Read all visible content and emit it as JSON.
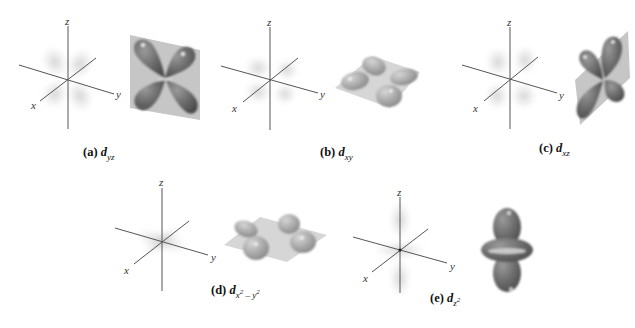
{
  "figure": {
    "panels": [
      {
        "id": "a",
        "letter": "(a)",
        "orbital": "d",
        "subscript": "yz",
        "sub_parts": [
          {
            "t": "yz"
          }
        ],
        "axes_labels": {
          "x": "x",
          "y": "y",
          "z": "z"
        },
        "description": "Four lobes lying in the yz plane, between the y and z axes"
      },
      {
        "id": "b",
        "letter": "(b)",
        "orbital": "d",
        "subscript": "xy",
        "sub_parts": [
          {
            "t": "xy"
          }
        ],
        "axes_labels": {
          "x": "x",
          "y": "y",
          "z": "z"
        },
        "description": "Four lobes lying in the xy plane, between the x and y axes"
      },
      {
        "id": "c",
        "letter": "(c)",
        "orbital": "d",
        "subscript": "xz",
        "sub_parts": [
          {
            "t": "xz"
          }
        ],
        "axes_labels": {
          "x": "x",
          "y": "y",
          "z": "z"
        },
        "description": "Four lobes lying in the xz plane, between the x and z axes"
      },
      {
        "id": "d",
        "letter": "(d)",
        "orbital": "d",
        "subscript": "x² − y²",
        "sub_parts": [
          {
            "t": "x",
            "sup": "2"
          },
          {
            "t": " – y",
            "sup": "2"
          }
        ],
        "axes_labels": {
          "x": "x",
          "y": "y",
          "z": "z"
        },
        "description": "Four lobes lying in the xy plane, along the x and y axes"
      },
      {
        "id": "e",
        "letter": "(e)",
        "orbital": "d",
        "subscript": "z²",
        "sub_parts": [
          {
            "t": "z",
            "sup": "2"
          }
        ],
        "axes_labels": {
          "x": "x",
          "y": "y",
          "z": "z"
        },
        "description": "Two lobes along the z axis with a torus (donut) in the xy plane"
      }
    ],
    "colors": {
      "lobe": "#6f6f6f",
      "lobe_light": "#a9a9a9",
      "plane": "#c4c4c4",
      "axis": "#555555",
      "cloud": "#d3d3d3",
      "background": "#ffffff"
    }
  }
}
